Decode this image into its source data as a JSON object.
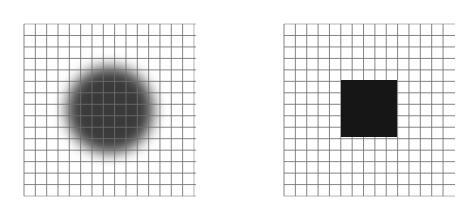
{
  "figure": {
    "background": "#ffffff",
    "grid_line_color": "#6e6e6e",
    "panels": [
      {
        "id": "left",
        "label": "blurred-spot-panel",
        "grid": {
          "x": 24,
          "y": 24,
          "cols": 15,
          "rows": 15,
          "cell_w": 11.33,
          "cell_h": 11.47,
          "h_line_overhang": 2
        },
        "shape": {
          "type": "blurred-circle",
          "cx": 110,
          "cy": 110,
          "r": 44,
          "color": "#3a3a3a"
        }
      },
      {
        "id": "right",
        "label": "sharp-square-panel",
        "grid": {
          "x": 284,
          "y": 24,
          "cols": 14,
          "rows": 15,
          "cell_w": 11.36,
          "cell_h": 11.47,
          "h_line_overhang": 12
        },
        "shape": {
          "type": "square",
          "x": 341,
          "y": 80,
          "w": 56,
          "h": 57,
          "color": "#161616"
        }
      }
    ]
  }
}
